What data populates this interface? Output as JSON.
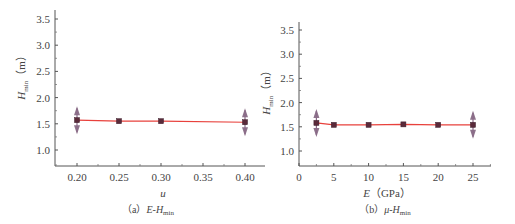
{
  "chart_data": [
    {
      "type": "line",
      "panel": "a",
      "caption": "（a）E-Hmin",
      "caption_parts": {
        "prefix": "（a）",
        "main": "E-H",
        "sub": "min"
      },
      "xlabel": "u",
      "ylabel": "Hmin（m）",
      "ylabel_parts": {
        "main": "H",
        "sub": "min",
        "unit": "（m）"
      },
      "xticks": [
        0.2,
        0.25,
        0.3,
        0.35,
        0.4
      ],
      "xtick_labels": [
        "0.20",
        "0.25",
        "0.30",
        "0.35",
        "0.40"
      ],
      "yticks": [
        1.0,
        1.5,
        2.0,
        2.5,
        3.0,
        3.5
      ],
      "ytick_labels": [
        "1.0",
        "1.5",
        "2.0",
        "2.5",
        "3.0",
        "3.5"
      ],
      "xlim": [
        0.174,
        0.424
      ],
      "ylim": [
        0.7,
        3.67
      ],
      "grid": false,
      "series": [
        {
          "name": "Hmin",
          "x": [
            0.2,
            0.25,
            0.3,
            0.4
          ],
          "values": [
            1.57,
            1.55,
            1.55,
            1.53
          ],
          "line_color": "#e8413c",
          "marker_color": "#5a2a3a",
          "errorbar_points": [
            0.2,
            0.4
          ]
        }
      ]
    },
    {
      "type": "line",
      "panel": "b",
      "caption": "（b）μ-Hmin",
      "caption_parts": {
        "prefix": "（b）",
        "main": "μ-H",
        "sub": "min"
      },
      "xlabel": "E（GPa）",
      "xlabel_parts": {
        "main": "E",
        "unit": "（GPa）"
      },
      "ylabel": "Hmin（m）",
      "ylabel_parts": {
        "main": "H",
        "sub": "min",
        "unit": "（m）"
      },
      "xticks": [
        0,
        5,
        10,
        15,
        20,
        25
      ],
      "xtick_labels": [
        "0",
        "5",
        "10",
        "15",
        "20",
        "25"
      ],
      "yticks": [
        1.0,
        1.5,
        2.0,
        2.5,
        3.0,
        3.5
      ],
      "ytick_labels": [
        "1.0",
        "1.5",
        "2.0",
        "2.5",
        "3.0",
        "3.5"
      ],
      "xlim": [
        0,
        27.6
      ],
      "ylim": [
        0.69,
        3.67
      ],
      "grid": false,
      "series": [
        {
          "name": "Hmin",
          "x": [
            2.5,
            5,
            10,
            15,
            20,
            25
          ],
          "values": [
            1.58,
            1.54,
            1.54,
            1.55,
            1.54,
            1.54
          ],
          "line_color": "#e8413c",
          "marker_color": "#5a2a3a",
          "errorbar_points": [
            2.5,
            25
          ]
        }
      ]
    }
  ]
}
